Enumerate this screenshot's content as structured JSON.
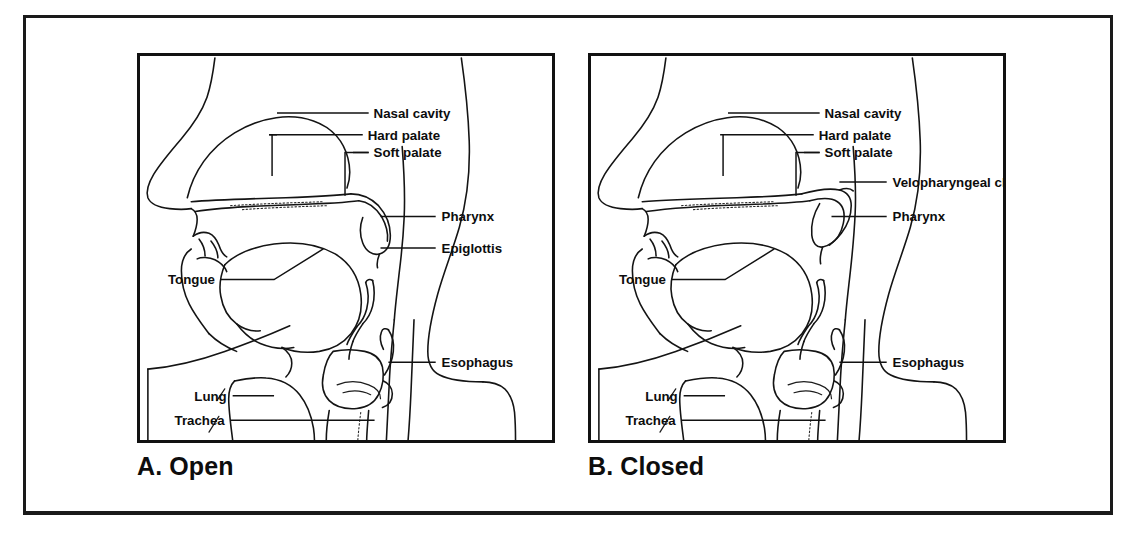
{
  "figure": {
    "type": "anatomical-diagram",
    "panel_count": 2
  },
  "panels": [
    {
      "id": "A",
      "caption": "A. Open",
      "state": "open",
      "labels": [
        {
          "name": "nasal-cavity",
          "text": "Nasal cavity"
        },
        {
          "name": "hard-palate",
          "text": "Hard palate"
        },
        {
          "name": "soft-palate",
          "text": "Soft palate"
        },
        {
          "name": "pharynx",
          "text": "Pharynx"
        },
        {
          "name": "epiglottis",
          "text": "Epiglottis"
        },
        {
          "name": "tongue",
          "text": "Tongue"
        },
        {
          "name": "esophagus",
          "text": "Esophagus"
        },
        {
          "name": "lung",
          "text": "Lung"
        },
        {
          "name": "trachea",
          "text": "Trachea"
        }
      ]
    },
    {
      "id": "B",
      "caption": "B. Closed",
      "state": "closed",
      "labels": [
        {
          "name": "nasal-cavity",
          "text": "Nasal cavity"
        },
        {
          "name": "hard-palate",
          "text": "Hard palate"
        },
        {
          "name": "soft-palate",
          "text": "Soft palate"
        },
        {
          "name": "velopharyngeal-closure",
          "text": "Velopharyngeal closure"
        },
        {
          "name": "pharynx",
          "text": "Pharynx"
        },
        {
          "name": "tongue",
          "text": "Tongue"
        },
        {
          "name": "esophagus",
          "text": "Esophagus"
        },
        {
          "name": "lung",
          "text": "Lung"
        },
        {
          "name": "trachea",
          "text": "Trachea"
        }
      ]
    }
  ],
  "colors": {
    "ink": "#111111",
    "background": "#ffffff",
    "frame": "#1a1a1a"
  }
}
